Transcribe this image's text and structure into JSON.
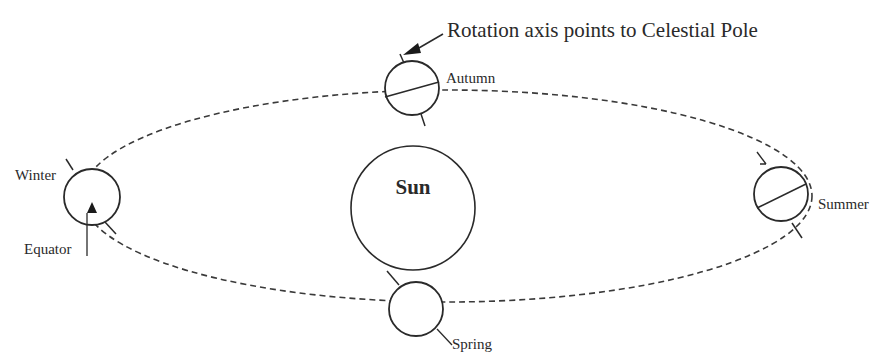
{
  "diagram": {
    "annotation": "Rotation axis points to Celestial Pole",
    "sun_label": "Sun",
    "equator_label": "Equator",
    "seasons": [
      {
        "id": "autumn",
        "label": "Autumn"
      },
      {
        "id": "winter",
        "label": "Winter"
      },
      {
        "id": "summer",
        "label": "Summer"
      },
      {
        "id": "spring",
        "label": "Spring"
      }
    ],
    "colors": {
      "line": "#2a2a2a",
      "orbit": "#3a3a3a",
      "background": "#ffffff"
    }
  }
}
